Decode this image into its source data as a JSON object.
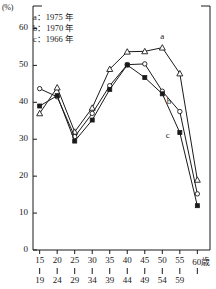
{
  "chart_data": {
    "type": "line",
    "title": "",
    "subtitle": "",
    "xlabel": "",
    "ylabel": "(%)",
    "unit_label": "(%)",
    "grid": false,
    "legend_position": "top-left",
    "categories": [
      "15\n19",
      "20\n24",
      "25\n29",
      "30\n34",
      "35\n39",
      "40\n44",
      "45\n49",
      "50\n54",
      "55\n59",
      "60歳"
    ],
    "category_upper": [
      "15",
      "20",
      "25",
      "30",
      "35",
      "40",
      "45",
      "50",
      "55",
      "60歳"
    ],
    "category_lower": [
      "19",
      "24",
      "29",
      "34",
      "39",
      "44",
      "49",
      "54",
      "59",
      ""
    ],
    "ylim": [
      0,
      65
    ],
    "yticks": [
      0,
      10,
      20,
      30,
      40,
      50,
      60
    ],
    "ytick_labels": [
      "0",
      "10",
      "20",
      "30",
      "40",
      "50",
      "60"
    ],
    "series": [
      {
        "name": "a",
        "legend_label": "a：1975 年",
        "year": "1975",
        "marker": "triangle",
        "values": [
          37.0,
          44.0,
          32.0,
          38.5,
          49.0,
          53.7,
          53.8,
          54.8,
          47.8,
          19.0
        ]
      },
      {
        "name": "b",
        "legend_label": "b：1970 年",
        "year": "1970",
        "marker": "circle",
        "values": [
          43.7,
          41.5,
          30.7,
          37.0,
          44.5,
          50.2,
          50.4,
          43.0,
          37.5,
          15.2
        ]
      },
      {
        "name": "c",
        "legend_label": "c：1966 年",
        "year": "1966",
        "marker": "square",
        "values": [
          39.0,
          41.8,
          29.5,
          35.2,
          43.5,
          50.1,
          46.7,
          42.3,
          31.8,
          12.0
        ]
      }
    ],
    "annotations": [
      {
        "text": "a",
        "series": "a",
        "x_index": 7
      },
      {
        "text": "b",
        "series": "b",
        "x_index": 8
      },
      {
        "text": "c",
        "series": "c",
        "x_index": 8
      }
    ],
    "colors": {
      "line": "#1a1a1a",
      "axis": "#1a1a1a",
      "background": "#ffffff"
    }
  },
  "legend": {
    "rows": [
      "a：1975 年",
      "b：1970 年",
      "c：1966 年"
    ]
  }
}
